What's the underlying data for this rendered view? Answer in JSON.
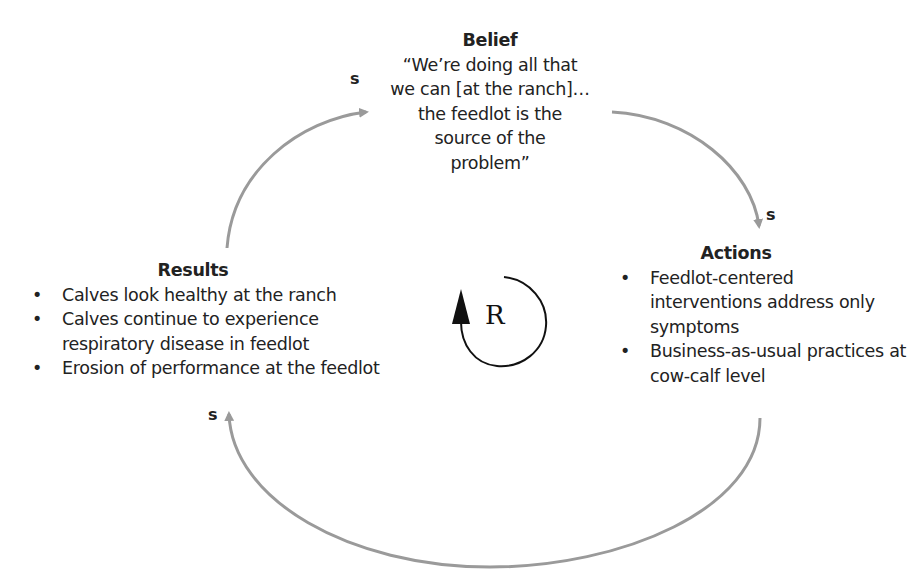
{
  "diagram": {
    "type": "causal-loop",
    "loop": {
      "label": "R",
      "meaning": "reinforcing"
    },
    "nodes": {
      "belief": {
        "title": "Belief",
        "lines": [
          "“We’re doing all that",
          "we can [at the ranch]…",
          "the feedlot is the",
          "source of the",
          "problem”"
        ]
      },
      "actions": {
        "title": "Actions",
        "items": [
          "Feedlot-centered interventions address only symptoms",
          "Business-as-usual practices at cow-calf level"
        ]
      },
      "results": {
        "title": "Results",
        "items": [
          "Calves look healthy at the ranch",
          "Calves continue to experience respiratory disease in feedlot",
          "Erosion of performance at the feedlot"
        ]
      }
    },
    "links": [
      {
        "from": "results",
        "to": "belief",
        "polarity": "s"
      },
      {
        "from": "belief",
        "to": "actions",
        "polarity": "s"
      },
      {
        "from": "actions",
        "to": "results",
        "polarity": "s"
      }
    ],
    "colors": {
      "arrow": "#9a9a9a",
      "text": "#222222",
      "loop_symbol": "#111111"
    }
  }
}
